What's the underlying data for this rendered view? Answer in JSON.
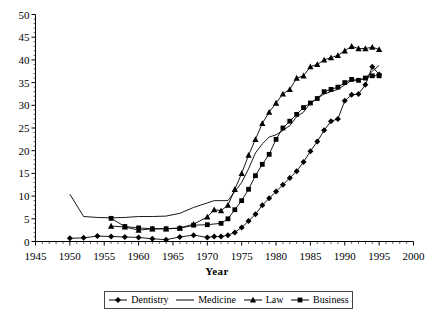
{
  "chart_data": {
    "type": "line",
    "title": "",
    "xlabel": "Year",
    "ylabel": "",
    "xlim": [
      1945,
      2000
    ],
    "ylim": [
      0,
      50
    ],
    "xticks": [
      1945,
      1950,
      1955,
      1960,
      1965,
      1970,
      1975,
      1980,
      1985,
      1990,
      1995,
      2000
    ],
    "yticks": [
      0,
      5,
      10,
      15,
      20,
      25,
      30,
      35,
      40,
      45,
      50
    ],
    "grid": false,
    "legend_position": "bottom",
    "series": [
      {
        "name": "Dentistry",
        "marker": "diamond",
        "x": [
          1950,
          1952,
          1954,
          1956,
          1958,
          1960,
          1962,
          1964,
          1966,
          1968,
          1970,
          1971,
          1972,
          1973,
          1974,
          1975,
          1976,
          1977,
          1978,
          1979,
          1980,
          1981,
          1982,
          1983,
          1984,
          1985,
          1986,
          1987,
          1988,
          1989,
          1990,
          1991,
          1992,
          1993,
          1994,
          1995
        ],
        "y": [
          0.7,
          0.8,
          1.2,
          1.1,
          1.0,
          0.9,
          0.6,
          0.4,
          1.0,
          1.4,
          0.9,
          1.1,
          1.1,
          1.4,
          2.0,
          3.1,
          4.5,
          6.0,
          8.0,
          9.5,
          11.0,
          12.5,
          14.0,
          15.5,
          17.5,
          19.9,
          22.0,
          24.5,
          26.5,
          27.0,
          31.0,
          32.3,
          32.5,
          34.5,
          38.5,
          36.8
        ]
      },
      {
        "name": "Medicine",
        "marker": "none",
        "x": [
          1950,
          1952,
          1954,
          1956,
          1958,
          1960,
          1962,
          1964,
          1966,
          1968,
          1970,
          1971,
          1972,
          1973,
          1974,
          1975,
          1976,
          1977,
          1978,
          1979,
          1980,
          1981,
          1982,
          1983,
          1984,
          1985,
          1986,
          1987,
          1988,
          1989,
          1990,
          1991,
          1992,
          1993,
          1994,
          1995
        ],
        "y": [
          10.4,
          5.5,
          5.3,
          5.2,
          5.3,
          5.5,
          5.5,
          5.6,
          6.2,
          7.5,
          8.5,
          9.0,
          9.0,
          9.0,
          11.0,
          13.0,
          16.0,
          19.5,
          21.5,
          23.0,
          23.5,
          24.5,
          25.5,
          27.5,
          28.5,
          30.5,
          31.5,
          32.5,
          33.0,
          33.5,
          34.5,
          35.5,
          35.5,
          36.0,
          37.5,
          38.8
        ]
      },
      {
        "name": "Law",
        "marker": "triangle",
        "x": [
          1956,
          1958,
          1960,
          1962,
          1964,
          1966,
          1968,
          1970,
          1971,
          1972,
          1973,
          1974,
          1975,
          1976,
          1977,
          1978,
          1979,
          1980,
          1981,
          1982,
          1983,
          1984,
          1985,
          1986,
          1987,
          1988,
          1989,
          1990,
          1991,
          1992,
          1993,
          1994,
          1995
        ],
        "y": [
          3.4,
          3.2,
          2.5,
          2.8,
          2.8,
          3.0,
          3.8,
          5.4,
          7.0,
          6.8,
          8.0,
          11.5,
          15.0,
          19.0,
          22.5,
          26.0,
          28.5,
          30.5,
          32.5,
          33.5,
          36.0,
          36.5,
          38.5,
          39.0,
          40.0,
          40.5,
          41.0,
          42.0,
          43.0,
          42.5,
          42.5,
          42.8,
          42.3
        ]
      },
      {
        "name": "Business",
        "marker": "square",
        "x": [
          1956,
          1958,
          1960,
          1962,
          1964,
          1966,
          1968,
          1970,
          1972,
          1973,
          1974,
          1975,
          1976,
          1977,
          1978,
          1979,
          1980,
          1981,
          1982,
          1983,
          1984,
          1985,
          1986,
          1987,
          1988,
          1989,
          1990,
          1991,
          1992,
          1993,
          1994,
          1995
        ],
        "y": [
          5.1,
          3.3,
          3.0,
          2.8,
          2.8,
          2.9,
          3.6,
          3.7,
          4.0,
          5.0,
          7.0,
          9.0,
          11.5,
          14.5,
          17.0,
          19.2,
          22.5,
          25.0,
          26.5,
          28.0,
          29.5,
          30.5,
          31.5,
          33.0,
          33.5,
          34.0,
          35.0,
          35.7,
          35.5,
          36.0,
          36.5,
          36.5
        ]
      }
    ]
  },
  "legend": {
    "items": [
      {
        "label": "Dentistry",
        "marker": "diamond"
      },
      {
        "label": "Medicine",
        "marker": "none"
      },
      {
        "label": "Law",
        "marker": "triangle"
      },
      {
        "label": "Business",
        "marker": "square"
      }
    ]
  },
  "axis": {
    "x_title": "Year"
  },
  "colors": {
    "line": "#000000",
    "axis": "#000000",
    "background": "#ffffff"
  }
}
